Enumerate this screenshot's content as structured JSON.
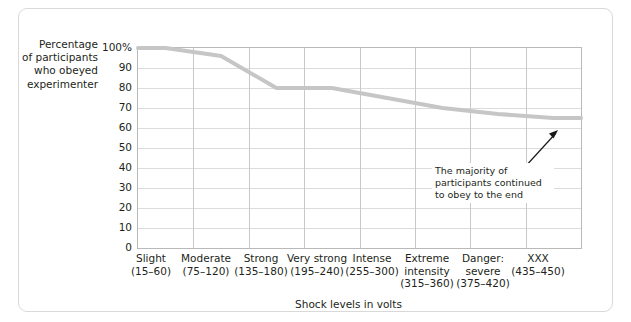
{
  "chart_data": {
    "type": "line",
    "title": "",
    "subtitle": "",
    "xlabel": "Shock levels in volts",
    "ylabel": "Percentage of participants who obeyed experimenter",
    "ylabel_lines": [
      "Percentage",
      "of participants",
      "who obeyed",
      "experimenter"
    ],
    "ylim": [
      0,
      100
    ],
    "yticks": [
      "100%",
      "90",
      "80",
      "70",
      "60",
      "50",
      "40",
      "30",
      "20",
      "10",
      "0"
    ],
    "ytick_values": [
      100,
      90,
      80,
      70,
      60,
      50,
      40,
      30,
      20,
      10,
      0
    ],
    "grid": true,
    "legend": "none",
    "categories": [
      {
        "name": "Slight",
        "range": "(15–60)"
      },
      {
        "name": "Moderate",
        "range": "(75–120)"
      },
      {
        "name": "Strong",
        "range": "(135–180)"
      },
      {
        "name": "Very strong",
        "range": "(195–240)"
      },
      {
        "name": "Intense",
        "range": "(255–300)"
      },
      {
        "name": "Extreme intensity",
        "range": "(315–360)"
      },
      {
        "name": "Danger: severe",
        "range": "(375–420)"
      },
      {
        "name": "XXX",
        "range": "(435–450)"
      }
    ],
    "values": [
      100,
      96,
      80,
      80,
      75,
      70,
      67,
      65
    ],
    "line_color": "#c6c6c6",
    "line_width": 4,
    "annotations": [
      {
        "text": "The majority of participants continued to obey to the end",
        "lines": [
          "The majority of",
          "participants continued",
          "to obey to the end"
        ],
        "arrow": true
      }
    ]
  },
  "card": {
    "border_color": "#d9d9d9",
    "background": "#ffffff"
  }
}
